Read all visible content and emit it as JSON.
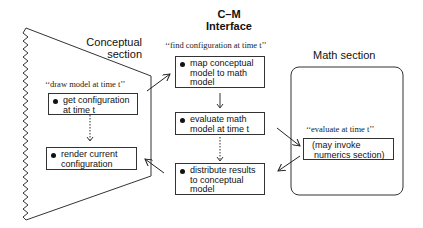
{
  "interface_header": {
    "line1": "C–M",
    "line2": "Interface"
  },
  "conceptual": {
    "title_line1": "Conceptual",
    "title_line2": "section",
    "quote": "‘‘draw model at time t’’",
    "boxes": [
      {
        "line1": "get configuration",
        "line2": "at time t"
      },
      {
        "line1": "render current",
        "line2": "configuration"
      }
    ]
  },
  "cm_interface": {
    "quote": "‘‘find configuration at time t’’",
    "boxes": [
      {
        "line1": "map conceptual",
        "line2": "model to math",
        "line3": "model"
      },
      {
        "line1": "evaluate math",
        "line2": "model at time t"
      },
      {
        "line1": "distribute results",
        "line2": "to conceptual",
        "line3": "model"
      }
    ]
  },
  "math": {
    "title": "Math section",
    "quote": "‘‘evaluate at time t’’",
    "box": {
      "line1": "(may invoke",
      "line2": "numerics section)"
    }
  }
}
